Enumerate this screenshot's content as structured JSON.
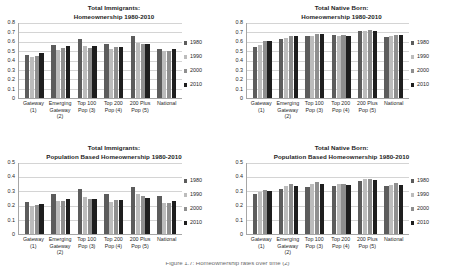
{
  "legend_years": [
    "1980",
    "1990",
    "2000",
    "2010"
  ],
  "legend_colors": {
    "1980": "#5c5c5c",
    "1990": "#bcbcbc",
    "2000": "#8f8f8f",
    "2010": "#1e1e1e"
  },
  "categories": [
    {
      "l1": "Gateway",
      "l2": "(1)",
      "l3": ""
    },
    {
      "l1": "Emerging",
      "l2": "Gateway",
      "l3": "(2)"
    },
    {
      "l1": "Top 100",
      "l2": "Pop (3)",
      "l3": ""
    },
    {
      "l1": "Top 200",
      "l2": "Pop (4)",
      "l3": ""
    },
    {
      "l1": "200 Plus",
      "l2": "Pop (5)",
      "l3": ""
    },
    {
      "l1": "National",
      "l2": "",
      "l3": ""
    }
  ],
  "caption": {
    "cut_text": "Figure 1.7: Homeownership rates over time (2)"
  },
  "chart_data": [
    {
      "id": "total-immigrants-homeownership",
      "type": "bar",
      "title": "Total Immigrants:",
      "subtitle": "Homeownership 1980-2010",
      "xlabel": "",
      "ylabel": "",
      "ylim": [
        0,
        0.8
      ],
      "yticks": [
        "0",
        "0.1",
        "0.2",
        "0.3",
        "0.4",
        "0.5",
        "0.6",
        "0.7",
        "0.8"
      ],
      "grid": true,
      "legend_position": "right",
      "categories": [
        "Gateway (1)",
        "Emerging Gateway (2)",
        "Top 100 Pop (3)",
        "Top 200 Pop (4)",
        "200 Plus Pop (5)",
        "National"
      ],
      "series": [
        {
          "name": "1980",
          "values": [
            0.46,
            0.57,
            0.63,
            0.58,
            0.66,
            0.52
          ]
        },
        {
          "name": "1990",
          "values": [
            0.44,
            0.51,
            0.55,
            0.52,
            0.59,
            0.5
          ]
        },
        {
          "name": "2000",
          "values": [
            0.45,
            0.53,
            0.53,
            0.54,
            0.58,
            0.5
          ]
        },
        {
          "name": "2010",
          "values": [
            0.48,
            0.56,
            0.55,
            0.54,
            0.58,
            0.52
          ]
        }
      ]
    },
    {
      "id": "total-native-born-homeownership",
      "type": "bar",
      "title": "Total Native Born:",
      "subtitle": "Homeownership 1980-2010",
      "xlabel": "",
      "ylabel": "",
      "ylim": [
        0,
        0.8
      ],
      "yticks": [
        "0",
        "0.1",
        "0.2",
        "0.3",
        "0.4",
        "0.5",
        "0.6",
        "0.7",
        "0.8"
      ],
      "grid": true,
      "legend_position": "right",
      "categories": [
        "Gateway (1)",
        "Emerging Gateway (2)",
        "Top 100 Pop (3)",
        "Top 200 Pop (4)",
        "200 Plus Pop (5)",
        "National"
      ],
      "series": [
        {
          "name": "1980",
          "values": [
            0.54,
            0.63,
            0.66,
            0.67,
            0.72,
            0.65
          ]
        },
        {
          "name": "1990",
          "values": [
            0.57,
            0.64,
            0.66,
            0.66,
            0.72,
            0.66
          ]
        },
        {
          "name": "2000",
          "values": [
            0.61,
            0.66,
            0.68,
            0.67,
            0.73,
            0.67
          ]
        },
        {
          "name": "2010",
          "values": [
            0.61,
            0.66,
            0.68,
            0.66,
            0.72,
            0.67
          ]
        }
      ]
    },
    {
      "id": "total-immigrants-population-based",
      "type": "bar",
      "title": "Total Immigrants:",
      "subtitle": "Population Based Homeownership 1980-2010",
      "xlabel": "",
      "ylabel": "",
      "ylim": [
        0,
        0.5
      ],
      "yticks": [
        "0",
        "0.1",
        "0.2",
        "0.3",
        "0.4",
        "0.5"
      ],
      "grid": true,
      "legend_position": "right",
      "categories": [
        "Gateway (1)",
        "Emerging Gateway (2)",
        "Top 100 Pop (3)",
        "Top 200 Pop (4)",
        "200 Plus Pop (5)",
        "National"
      ],
      "series": [
        {
          "name": "1980",
          "values": [
            0.225,
            0.285,
            0.315,
            0.28,
            0.33,
            0.265
          ]
        },
        {
          "name": "1990",
          "values": [
            0.2,
            0.235,
            0.26,
            0.225,
            0.285,
            0.22
          ]
        },
        {
          "name": "2000",
          "values": [
            0.205,
            0.235,
            0.25,
            0.24,
            0.265,
            0.22
          ]
        },
        {
          "name": "2010",
          "values": [
            0.21,
            0.245,
            0.25,
            0.24,
            0.255,
            0.23
          ]
        }
      ]
    },
    {
      "id": "total-native-born-population-based",
      "type": "bar",
      "title": "Total Native Born:",
      "subtitle": "Population Based Homeownership 1980-2010",
      "xlabel": "",
      "ylabel": "",
      "ylim": [
        0,
        0.5
      ],
      "yticks": [
        "0",
        "0.1",
        "0.2",
        "0.3",
        "0.4",
        "0.5"
      ],
      "grid": true,
      "legend_position": "right",
      "categories": [
        "Gateway (1)",
        "Emerging Gateway (2)",
        "Top 100 Pop (3)",
        "Top 200 Pop (4)",
        "200 Plus Pop (5)",
        "National"
      ],
      "series": [
        {
          "name": "1980",
          "values": [
            0.28,
            0.32,
            0.33,
            0.34,
            0.37,
            0.335
          ]
        },
        {
          "name": "1990",
          "values": [
            0.295,
            0.335,
            0.355,
            0.35,
            0.385,
            0.345
          ]
        },
        {
          "name": "2000",
          "values": [
            0.31,
            0.35,
            0.365,
            0.35,
            0.39,
            0.36
          ]
        },
        {
          "name": "2010",
          "values": [
            0.3,
            0.34,
            0.35,
            0.345,
            0.38,
            0.345
          ]
        }
      ]
    }
  ]
}
